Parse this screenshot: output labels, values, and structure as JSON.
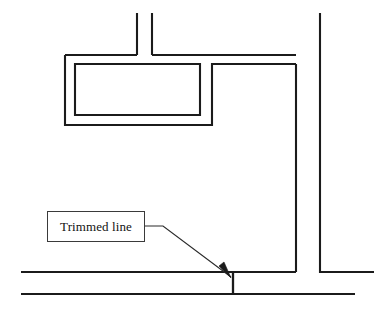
{
  "figure": {
    "domain_kind": "cad-floor-plan-annotation",
    "background_color": "#ffffff",
    "line_color": "#1b1b1b",
    "width": 374,
    "height": 311
  },
  "annotation": {
    "callout_label": "Trimmed line",
    "callout_box": {
      "x": 47,
      "y": 211,
      "width": 98,
      "height": 31,
      "border_color": "#3a3a3a",
      "fill_color": "#ffffff"
    },
    "leader": {
      "elbow_path": "M 145 226 L 163 226 L 231 277",
      "arrow_tip_x": 231,
      "arrow_tip_y": 277,
      "arrowhead_points": "231,278 219,266 224,262"
    }
  },
  "geometry": {
    "walls": [
      {
        "name": "top-duct-left-vertical",
        "d": "M 137 13 L 137 55"
      },
      {
        "name": "top-duct-right-vertical",
        "d": "M 152 13 L 152 55"
      },
      {
        "name": "upper-corridor-left-branch",
        "d": "M 65 55 L 137 55"
      },
      {
        "name": "upper-corridor-right-branch",
        "d": "M 152 55 L 296 55"
      },
      {
        "name": "outer-room-wall",
        "d": "M 65 55 L 65 125 L 212 125 L 212 64 L 296 64"
      },
      {
        "name": "inner-room-rectangle",
        "d": "M 75 64 L 200 64 L 200 115 L 75 115 Z"
      },
      {
        "name": "right-vertical-inner",
        "d": "M 296 64 L 296 272"
      },
      {
        "name": "right-vertical-outer",
        "d": "M 320 13 L 320 272 L 374 272"
      },
      {
        "name": "lower-corridor-upper-line",
        "d": "M 21 272 L 296 272"
      },
      {
        "name": "lower-corridor-lower-line",
        "d": "M 21 294 L 355 294"
      }
    ],
    "trimmed_line": {
      "name": "trimmed-line-stub",
      "d": "M 233 272 L 233 294",
      "x": 233,
      "y_top": 272,
      "y_bottom": 294
    }
  }
}
